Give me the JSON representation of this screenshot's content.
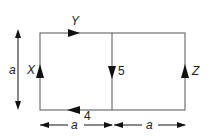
{
  "diagram": {
    "type": "circuit-loops",
    "labels": {
      "top_edge": "Y",
      "left_edge": "X",
      "right_edge": "Z",
      "middle_edge": "5",
      "bottom_edge": "4",
      "height": "a",
      "width_left": "a",
      "width_right": "a"
    },
    "colors": {
      "line": "#555555",
      "arrow": "#111111"
    }
  }
}
